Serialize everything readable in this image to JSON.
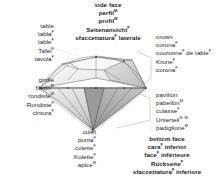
{
  "diagram": {
    "languages": [
      "English",
      "Spanish",
      "French",
      "German",
      "Italian"
    ],
    "colors": {
      "text": "#1d1d1d",
      "background": "#ffffff",
      "outline": "#3a3a3a",
      "leader_line": "#b4b4b4",
      "facet_light": "#f2f2f2",
      "facet_mid": "#d8d8d8",
      "facet_dark": "#a8a8a8"
    }
  },
  "labels": {
    "side_face": {
      "name": "side-face",
      "align": "center",
      "bold": true,
      "lines": [
        {
          "text": "side face",
          "sup": ""
        },
        {
          "text": "perfil",
          "sup": "M"
        },
        {
          "text": "profil",
          "sup": "M"
        },
        {
          "text": "Seitenansicht",
          "sup": "F"
        },
        {
          "text": "sfaccettatura",
          "sup": "F",
          "tail": " laterale"
        }
      ]
    },
    "table": {
      "name": "table",
      "align": "right",
      "bold": false,
      "lines": [
        {
          "text": "table",
          "sup": ""
        },
        {
          "text": "tabla",
          "sup": "F"
        },
        {
          "text": "table",
          "sup": "F"
        },
        {
          "text": "Tafel",
          "sup": "F"
        },
        {
          "text": "tavola",
          "sup": "F"
        }
      ]
    },
    "girdle": {
      "name": "girdle",
      "align": "right",
      "bold": false,
      "lines": [
        {
          "text": "girdle",
          "sup": ""
        },
        {
          "text": "filetín",
          "sup": "M"
        },
        {
          "text": "rondiste",
          "sup": "M"
        },
        {
          "text": "Rondiste",
          "sup": "F"
        },
        {
          "text": "cintura",
          "sup": "F"
        }
      ]
    },
    "culet": {
      "name": "culet",
      "align": "right",
      "bold": false,
      "lines": [
        {
          "text": "culet",
          "sup": ""
        },
        {
          "text": "punta",
          "sup": "F"
        },
        {
          "text": "colette",
          "sup": "F"
        },
        {
          "text": "Kulette",
          "sup": "F"
        },
        {
          "text": "apice",
          "sup": "M"
        }
      ]
    },
    "crown": {
      "name": "crown",
      "align": "left",
      "bold": false,
      "lines": [
        {
          "text": "crown",
          "sup": ""
        },
        {
          "text": "corona",
          "sup": "F"
        },
        {
          "text": "couronne",
          "sup": "F",
          "tail": " de table",
          "tail_sup": "F"
        },
        {
          "text": "Krone",
          "sup": "F"
        },
        {
          "text": "corona",
          "sup": "F"
        }
      ]
    },
    "pavilion": {
      "name": "pavilion",
      "align": "left",
      "bold": false,
      "lines": [
        {
          "text": "pavilion",
          "sup": ""
        },
        {
          "text": "pabellón",
          "sup": "M"
        },
        {
          "text": "culasse",
          "sup": "F"
        },
        {
          "text": "Unterteil",
          "sup": "N, M"
        },
        {
          "text": "padiglione",
          "sup": "M"
        }
      ]
    },
    "bottom_face": {
      "name": "bottom-face",
      "align": "center",
      "bold": true,
      "lines": [
        {
          "text": "bottom face",
          "sup": ""
        },
        {
          "text": "cara",
          "sup": "F",
          "tail": " inferior"
        },
        {
          "text": "face",
          "sup": "F",
          "tail": " inférieure"
        },
        {
          "text": "Rückseite",
          "sup": "F"
        },
        {
          "text": "sfaccettatura",
          "sup": "F",
          "tail": " inferiore"
        }
      ]
    }
  }
}
